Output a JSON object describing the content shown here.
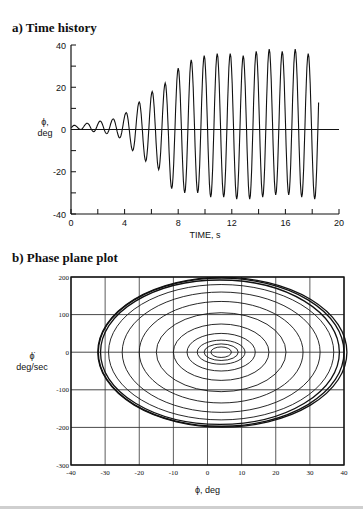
{
  "panels": {
    "a": {
      "title": "a) Time history"
    },
    "b": {
      "title": "b) Phase plane plot"
    }
  },
  "chart_data": [
    {
      "type": "line",
      "title": "a) Time history",
      "xlabel": "TIME, s",
      "ylabel": "ϕ, deg",
      "ylabel_line1": "ϕ,",
      "ylabel_line2": "deg",
      "xlim": [
        0,
        20
      ],
      "ylim": [
        -40,
        40
      ],
      "xticks": [
        0,
        4,
        8,
        12,
        16,
        20
      ],
      "yticks": [
        -40,
        -20,
        0,
        20,
        40
      ],
      "x_minor_step": 2,
      "y_minor_step": 10,
      "grid": false,
      "zero_line": true,
      "period_s": 0.97,
      "t_end": 18.5,
      "peaks": [
        2,
        3,
        4,
        5,
        8,
        13,
        18,
        22,
        29,
        33,
        35,
        36,
        36,
        35,
        37,
        38,
        37,
        38,
        36,
        37,
        38
      ],
      "troughs": [
        0,
        -1,
        -2,
        -4,
        -10,
        -15,
        -19,
        -28,
        -30,
        -30,
        -32,
        -32,
        -33,
        -33,
        -32,
        -31,
        -31,
        -32,
        -33
      ]
    },
    {
      "type": "line",
      "title": "b) Phase plane plot",
      "xlabel": "ϕ, deg",
      "ylabel": "ϕ̇ deg/sec",
      "ylabel_line1": "ϕ̇",
      "ylabel_line2": "deg/sec",
      "xlim": [
        -40,
        40
      ],
      "ylim": [
        -300,
        200
      ],
      "xticks": [
        -40,
        -30,
        -20,
        -10,
        0,
        10,
        20,
        30,
        40
      ],
      "yticks": [
        -300,
        -200,
        -100,
        0,
        100,
        200
      ],
      "grid": true,
      "center": [
        4,
        0
      ],
      "orbits": [
        {
          "rx": 3,
          "ry": 14
        },
        {
          "rx": 5,
          "ry": 22
        },
        {
          "rx": 7,
          "ry": 32
        },
        {
          "rx": 10,
          "ry": 50
        },
        {
          "rx": 14,
          "ry": 75
        },
        {
          "rx": 19,
          "ry": 105
        },
        {
          "rx": 24,
          "ry": 135
        },
        {
          "rx": 29,
          "ry": 160
        },
        {
          "rx": 33,
          "ry": 180
        },
        {
          "rx": 35,
          "ry": 192
        },
        {
          "rx": 36,
          "ry": 197
        },
        {
          "rx": 36.5,
          "ry": 199
        }
      ]
    }
  ]
}
